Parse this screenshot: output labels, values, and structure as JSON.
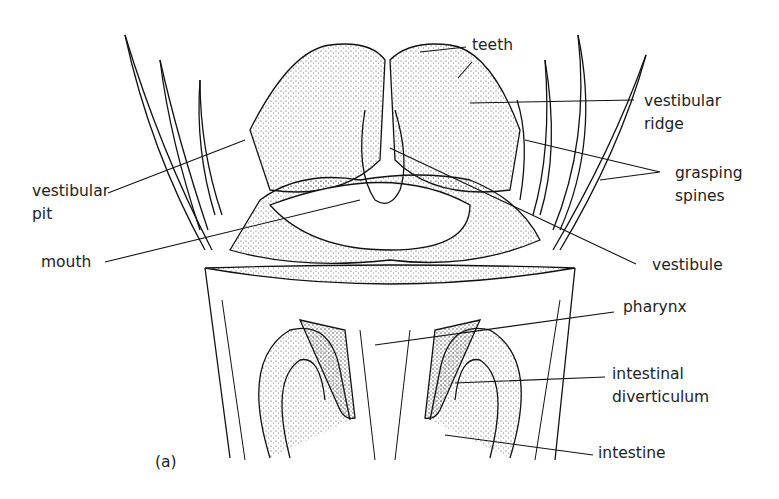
{
  "figure": {
    "panel_label": "(a)",
    "labels": {
      "teeth": "teeth",
      "vestibular_ridge_1": "vestibular",
      "vestibular_ridge_2": "ridge",
      "grasping_spines_1": "grasping",
      "grasping_spines_2": "spines",
      "vestibular_pit_1": "vestibular",
      "vestibular_pit_2": "pit",
      "mouth": "mouth",
      "vestibule": "vestibule",
      "pharynx": "pharynx",
      "intestinal_diverticulum_1": "intestinal",
      "intestinal_diverticulum_2": "diverticulum",
      "intestine": "intestine"
    }
  }
}
